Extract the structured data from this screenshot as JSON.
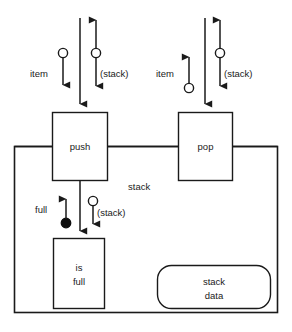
{
  "diagram": {
    "colors": {
      "stroke": "#1a1a1a",
      "fill": "#ffffff",
      "solid_marker": "#0d0d0d"
    },
    "modules": [
      {
        "id": "push",
        "label": "push"
      },
      {
        "id": "pop",
        "label": "pop"
      },
      {
        "id": "is-full",
        "label_line1": "is",
        "label_line2": "full"
      }
    ],
    "data_store": {
      "id": "stack-data",
      "label_line1": "stack",
      "label_line2": "data"
    },
    "container_label": "stack",
    "flows": {
      "push_item": {
        "label": "item",
        "marker": "hollow",
        "direction": "down"
      },
      "push_stack": {
        "label": "(stack)",
        "marker": "hollow",
        "direction": "down-up"
      },
      "pop_item": {
        "label": "item",
        "marker": "hollow",
        "direction": "up"
      },
      "pop_stack": {
        "label": "(stack)",
        "marker": "hollow",
        "direction": "down-up"
      },
      "full_flag": {
        "label": "full",
        "marker": "solid",
        "direction": "up"
      },
      "isfull_stack": {
        "label": "(stack)",
        "marker": "hollow",
        "direction": "down"
      }
    }
  }
}
